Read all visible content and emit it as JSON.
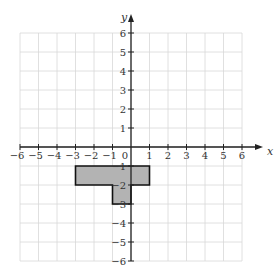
{
  "chart_data": {
    "type": "coordinate-grid",
    "title": "",
    "xlabel": "x",
    "ylabel": "y",
    "xlim": [
      -6,
      6
    ],
    "ylim": [
      -6,
      6
    ],
    "grid": true,
    "x_ticks": [
      -6,
      -5,
      -4,
      -3,
      -2,
      -1,
      1,
      2,
      3,
      4,
      5,
      6
    ],
    "y_ticks": [
      6,
      5,
      4,
      3,
      2,
      1,
      -1,
      -2,
      -3,
      -4,
      -5,
      -6
    ],
    "origin_label": "0",
    "shapes": [
      {
        "name": "shaded-polygon",
        "fill": "#b3b3b3",
        "stroke": "#111111",
        "vertices": [
          [
            -3,
            -1
          ],
          [
            1,
            -1
          ],
          [
            1,
            -2
          ],
          [
            0,
            -2
          ],
          [
            0,
            -3
          ],
          [
            -1,
            -3
          ],
          [
            -1,
            -2
          ],
          [
            -3,
            -2
          ]
        ]
      }
    ]
  },
  "colors": {
    "grid": "#d8d8d8",
    "axis": "#222222",
    "shape_fill": "#b3b3b3"
  }
}
